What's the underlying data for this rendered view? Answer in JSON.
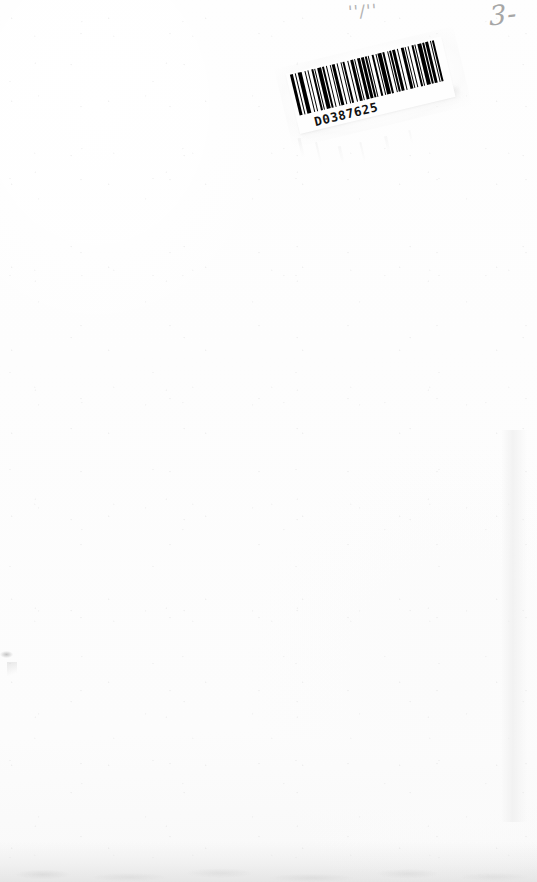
{
  "document": {
    "type": "scanned-blank-page",
    "page_width": 537,
    "page_height": 882,
    "background_color": "#fdfdfd",
    "description": "Blank scanned book page with barcode label and handwritten pencil annotations"
  },
  "barcode": {
    "value": "D0387625",
    "symbology_appearance": "linear-bars",
    "rotation_degrees": -13.5,
    "ink_color": "#000000",
    "label_color": "#fefefe",
    "bar_pattern": [
      3,
      2,
      1,
      2,
      3,
      3,
      1,
      2,
      1,
      3,
      2,
      1,
      1,
      2,
      3,
      1,
      2,
      2,
      1,
      3,
      1,
      1,
      3,
      2,
      1,
      2,
      1,
      1,
      2,
      3,
      1,
      2,
      3,
      1,
      1,
      2,
      2,
      1,
      3,
      1,
      2,
      1,
      1,
      3,
      2,
      2,
      1,
      1,
      3,
      1,
      2,
      3,
      1,
      1,
      2,
      1,
      3,
      2,
      1,
      2,
      3,
      1,
      1,
      2,
      1,
      3,
      2,
      1,
      1,
      2,
      3,
      1,
      2,
      1,
      3,
      2,
      1,
      1,
      2,
      3
    ]
  },
  "annotations": {
    "fraction_mark": {
      "text": "''/''",
      "color": "#b2b2b2",
      "medium": "pencil",
      "position": "top-center"
    },
    "page_number_mark": {
      "text": "3-",
      "color": "#a6a6a6",
      "medium": "pencil",
      "position": "top-right"
    }
  },
  "artifacts": {
    "left_edge_smudge": "faint-gray-smudge",
    "bottom_shadow_band": "scanner-edge-shadow",
    "right_tonal_band": "faint-vertical-tone"
  }
}
